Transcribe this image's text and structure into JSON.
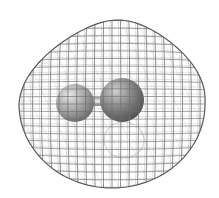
{
  "figure": {
    "background_color": "#ffffff",
    "isosurface": {
      "style": "wireframe mesh",
      "line_color": "#6e6e6e",
      "meridians": 22,
      "parallels": 24
    },
    "atoms": [
      {
        "name": "left-atom",
        "cx": 75,
        "cy": 103,
        "r": 19,
        "color": "#a9a9a9"
      },
      {
        "name": "right-atom",
        "cx": 122,
        "cy": 100,
        "r": 22,
        "color": "#8a8a8a"
      }
    ],
    "bond": {
      "color": "#c8c8c8"
    }
  }
}
